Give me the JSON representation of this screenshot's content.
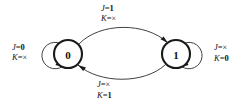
{
  "diagram": {
    "type": "state-transition-diagram",
    "background_color": "#ffffff",
    "stroke_color": "#2b2b2b",
    "text_color": "#141414",
    "states": [
      {
        "id": "state0",
        "label": "0",
        "cx": 68,
        "cy": 54,
        "r": 14
      },
      {
        "id": "state1",
        "label": "1",
        "cx": 176,
        "cy": 54,
        "r": 14
      }
    ],
    "transitions": [
      {
        "id": "t-0-to-0",
        "from": "0",
        "to": "0",
        "kind": "self-loop",
        "label_var_1": "J",
        "label_eq": "=",
        "label_val_1": "0",
        "label_var_2": "K",
        "label_val_2": "×",
        "label_text": "J=0 K=×"
      },
      {
        "id": "t-0-to-1",
        "from": "0",
        "to": "1",
        "kind": "arc-top",
        "label_var_1": "J",
        "label_eq": "=",
        "label_val_1": "1",
        "label_var_2": "K",
        "label_val_2": "×",
        "label_text": "J=1 K=×"
      },
      {
        "id": "t-1-to-0",
        "from": "1",
        "to": "0",
        "kind": "arc-bottom",
        "label_var_1": "J",
        "label_eq": "=",
        "label_val_1": "×",
        "label_var_2": "K",
        "label_val_2": "1",
        "label_text": "J=× K=1"
      },
      {
        "id": "t-1-to-1",
        "from": "1",
        "to": "1",
        "kind": "self-loop",
        "label_var_1": "J",
        "label_eq": "=",
        "label_val_1": "×",
        "label_var_2": "K",
        "label_val_2": "0",
        "label_text": "J=× K=0"
      }
    ]
  }
}
